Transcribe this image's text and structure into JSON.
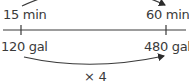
{
  "diagram": {
    "type": "double-number-line",
    "top_line": {
      "unit": "min",
      "labels": [
        "15 min",
        "60 min"
      ],
      "values": [
        15,
        60
      ]
    },
    "bottom_line": {
      "unit": "gal",
      "labels": [
        "120 gal",
        "480 gal"
      ],
      "values": [
        120,
        480
      ]
    },
    "multiplier_label": "× 4",
    "colors": {
      "line": "#3a3a3a",
      "text": "#3a3a3a",
      "background": "#ffffff"
    }
  }
}
